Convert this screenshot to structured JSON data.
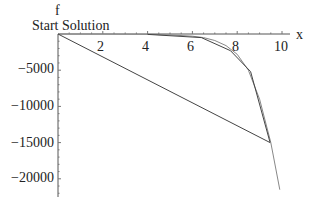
{
  "chart_data": {
    "type": "line",
    "title": "",
    "xlabel": "x",
    "ylabel": "f",
    "xlim": [
      0,
      10.3
    ],
    "ylim": [
      -22500,
      0
    ],
    "x_ticks": [
      "2",
      "4",
      "6",
      "8",
      "10"
    ],
    "y_ticks": [
      "-5000",
      "-10000",
      "-15000",
      "-20000"
    ],
    "annotations": [
      "Start Solution"
    ],
    "grid": false,
    "legend": "none",
    "series": [
      {
        "name": "f(x) curve",
        "x": [
          0,
          2,
          4,
          5,
          6,
          6.5,
          7,
          7.5,
          8,
          8.5,
          9,
          9.5,
          9.9
        ],
        "y": [
          0,
          0,
          -40,
          -120,
          -300,
          -500,
          -900,
          -1600,
          -2800,
          -5000,
          -9000,
          -15000,
          -21500
        ]
      },
      {
        "name": "search path",
        "x": [
          0,
          9.47,
          8.6,
          7.7,
          6.4,
          4.0
        ],
        "y": [
          0,
          -15000,
          -5200,
          -2300,
          -500,
          -50
        ]
      }
    ]
  },
  "labels": {
    "y_axis": "f",
    "x_axis": "x",
    "start": "Start Solution",
    "xt": [
      "2",
      "4",
      "6",
      "8",
      "10"
    ],
    "yt": [
      "−5000",
      "−10000",
      "−15000",
      "−20000"
    ]
  }
}
